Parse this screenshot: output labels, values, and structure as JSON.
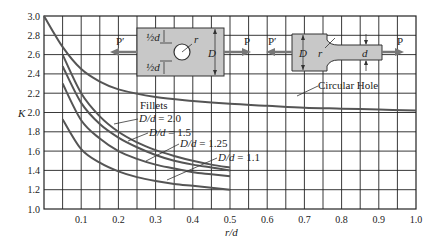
{
  "chart_data": {
    "type": "line",
    "title": "",
    "xlabel": "r/d",
    "ylabel": "K",
    "xlim": [
      0,
      1.0
    ],
    "ylim": [
      1.0,
      3.0
    ],
    "grid": true,
    "x_ticks": [
      "0.1",
      "0.2",
      "0.3",
      "0.4",
      "0.5",
      "0.6",
      "0.7",
      "0.8",
      "0.9",
      "1.0"
    ],
    "y_ticks": [
      "1.0",
      "1.2",
      "1.4",
      "1.6",
      "1.8",
      "2.0",
      "2.2",
      "2.4",
      "2.6",
      "2.8",
      "3.0"
    ],
    "series": [
      {
        "name": "Circular Hole",
        "x": [
          0.0,
          0.05,
          0.1,
          0.15,
          0.2,
          0.3,
          0.4,
          0.5,
          0.6,
          0.7,
          0.8,
          0.9,
          1.0
        ],
        "y": [
          3.0,
          2.68,
          2.45,
          2.32,
          2.24,
          2.16,
          2.12,
          2.09,
          2.07,
          2.05,
          2.04,
          2.03,
          2.02
        ]
      },
      {
        "name": "D/d = 2.0",
        "x": [
          0.05,
          0.1,
          0.15,
          0.2,
          0.25,
          0.3,
          0.35,
          0.4,
          0.45,
          0.5
        ],
        "y": [
          2.6,
          2.2,
          1.96,
          1.8,
          1.69,
          1.61,
          1.55,
          1.5,
          1.46,
          1.43
        ]
      },
      {
        "name": "D/d = 1.5",
        "x": [
          0.05,
          0.1,
          0.15,
          0.2,
          0.25,
          0.3,
          0.35,
          0.4,
          0.45,
          0.5
        ],
        "y": [
          2.48,
          2.1,
          1.88,
          1.74,
          1.64,
          1.56,
          1.5,
          1.46,
          1.43,
          1.4
        ]
      },
      {
        "name": "D/d = 1.25",
        "x": [
          0.05,
          0.1,
          0.15,
          0.2,
          0.25,
          0.3,
          0.35,
          0.4,
          0.45,
          0.5
        ],
        "y": [
          2.3,
          1.92,
          1.73,
          1.6,
          1.52,
          1.46,
          1.42,
          1.38,
          1.36,
          1.34
        ]
      },
      {
        "name": "D/d = 1.1",
        "x": [
          0.05,
          0.1,
          0.15,
          0.2,
          0.25,
          0.3,
          0.35,
          0.4,
          0.45,
          0.5
        ],
        "y": [
          1.93,
          1.62,
          1.48,
          1.39,
          1.33,
          1.29,
          1.26,
          1.24,
          1.22,
          1.2
        ]
      }
    ],
    "annotations": [
      "Circular Hole",
      "Fillets",
      "D/d = 2.0",
      "D/d = 1.5",
      "D/d = 1.25",
      "D/d = 1.1"
    ],
    "legend_position": "inline annotations"
  },
  "diagrams": {
    "hole_plate": {
      "left_load": "P′",
      "right_load": "P",
      "top_dim": "½d",
      "bottom_dim": "½d",
      "radius": "r",
      "width": "D"
    },
    "fillet_bar": {
      "left_load": "P′",
      "right_load": "P",
      "wide": "D",
      "narrow": "d",
      "radius": "r"
    }
  },
  "labels": {
    "xlabel": "r/d",
    "ylabel": "K",
    "circular_hole": "Circular Hole",
    "fillets": "Fillets",
    "dd20": "D/d = 2.0",
    "dd15": "D/d = 1.5",
    "dd125": "D/d = 1.25",
    "dd11": "D/d = 1.1"
  }
}
